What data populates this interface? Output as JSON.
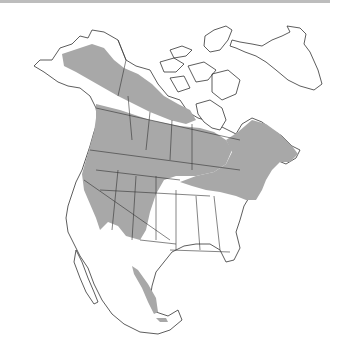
{
  "map": {
    "title": "Species range map - North America",
    "region": "North America",
    "range_color": "#a8a8a8",
    "outline_color": "#333333",
    "background_color": "#ffffff",
    "legend": [],
    "range_areas": [
      "Alaska interior",
      "Western Canada (Yukon, NWT south, BC, Alberta, Saskatchewan, Manitoba)",
      "Ontario, Quebec, Atlantic Canada",
      "Western & northern United States",
      "Northeastern United States",
      "Western Mexico Sierra Madre"
    ]
  }
}
